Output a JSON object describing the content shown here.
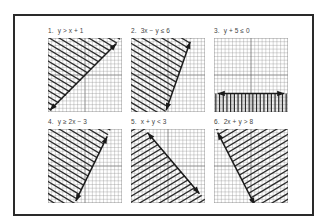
{
  "figure": {
    "grid": {
      "cells": 20,
      "axis_index": 10,
      "line_color": "#8a8a8a",
      "axis_color": "#555555",
      "hatch_color": "#2b2b2b",
      "border_color": "#777777"
    },
    "panels": [
      {
        "number": "1.",
        "inequality": "y > x + 1",
        "boundary": {
          "x1": 0.5,
          "y1": 19.5,
          "x2": 18.5,
          "y2": 1.5
        },
        "shade": "upper-left",
        "hatch": "diag-down",
        "polygon": [
          [
            0,
            0
          ],
          [
            19.5,
            0
          ],
          [
            19.5,
            0.5
          ],
          [
            0.5,
            20
          ],
          [
            0,
            20
          ]
        ]
      },
      {
        "number": "2.",
        "inequality": "3x − y ≤ 6",
        "boundary": {
          "x1": 9.5,
          "y1": 19.5,
          "x2": 16,
          "y2": 1
        },
        "shade": "left",
        "hatch": "diag-down",
        "polygon": [
          [
            0,
            0
          ],
          [
            16.3,
            0
          ],
          [
            9.3,
            20
          ],
          [
            0,
            20
          ]
        ]
      },
      {
        "number": "3.",
        "inequality": "y + 5 ≤ 0",
        "boundary": {
          "x1": 1,
          "y1": 15,
          "x2": 19,
          "y2": 15
        },
        "shade": "below",
        "hatch": "vertical",
        "polygon": [
          [
            0,
            15
          ],
          [
            20,
            15
          ],
          [
            20,
            20
          ],
          [
            0,
            20
          ]
        ]
      },
      {
        "number": "4.",
        "inequality": "y ≥ 2x − 3",
        "boundary": {
          "x1": 7.5,
          "y1": 19.5,
          "x2": 16,
          "y2": 2
        },
        "shade": "left",
        "hatch": "diag-down",
        "polygon": [
          [
            0,
            0
          ],
          [
            17,
            0
          ],
          [
            7.3,
            20
          ],
          [
            0,
            20
          ]
        ]
      },
      {
        "number": "5.",
        "inequality": "x + y < 3",
        "boundary": {
          "x1": 4.5,
          "y1": 1,
          "x2": 18.5,
          "y2": 17.5
        },
        "shade": "lower-left",
        "hatch": "diag-up",
        "polygon": [
          [
            0,
            0
          ],
          [
            3.8,
            0
          ],
          [
            20,
            19
          ],
          [
            20,
            20
          ],
          [
            0,
            20
          ]
        ]
      },
      {
        "number": "6.",
        "inequality": "2x + y > 8",
        "boundary": {
          "x1": 1,
          "y1": 1,
          "x2": 11,
          "y2": 20.5
        },
        "shade": "right",
        "hatch": "diag-up",
        "polygon": [
          [
            0.5,
            0
          ],
          [
            20,
            0
          ],
          [
            20,
            20
          ],
          [
            10.7,
            20
          ]
        ]
      }
    ]
  }
}
